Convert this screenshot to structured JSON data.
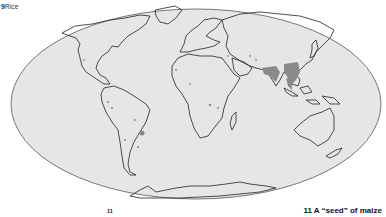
{
  "figure": {
    "number": "9",
    "title": "Rice"
  },
  "map": {
    "projection": "mollweide-style ellipse",
    "ocean_color": "#e6e6e6",
    "land_outline_color": "#222222",
    "rice_region_color": "#8a8a8a",
    "legend_meaning": "rice cultivation areas (shaded)"
  },
  "footer": {
    "page_marker": "11",
    "next_caption": "11 A “seed” of maize"
  }
}
